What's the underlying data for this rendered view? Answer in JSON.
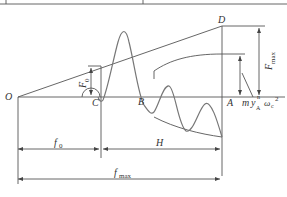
{
  "diagram": {
    "points": {
      "O": "O",
      "C": "C",
      "B": "B",
      "A": "A",
      "D": "D"
    },
    "labels": {
      "F0_main": "F",
      "F0_sub": "0",
      "Fmax_main": "F",
      "Fmax_sub": "max",
      "myA_m": "m",
      "myA_y": "y",
      "myA_sup": "n",
      "myA_sub": "A",
      "omega": "ω",
      "omega_sub": "c",
      "omega_sup": "2",
      "f0_main": "f",
      "f0_sub": "0",
      "H": "H",
      "fmax_main": "f",
      "fmax_sub": "max"
    },
    "colors": {
      "line": "#555555",
      "wave": "#777777",
      "text": "#333333"
    }
  }
}
